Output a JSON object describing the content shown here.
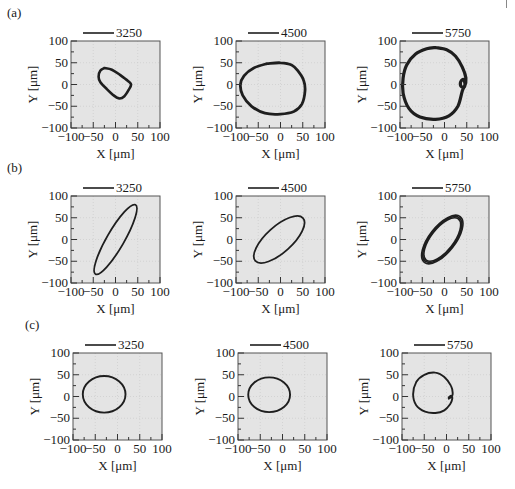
{
  "figure": {
    "rows": [
      {
        "label": "(a)",
        "label_pos": [
          7,
          17
        ]
      },
      {
        "label": "(b)",
        "label_pos": [
          7,
          172
        ]
      },
      {
        "label": "(c)",
        "label_pos": [
          25,
          329
        ]
      }
    ],
    "column_lefts": [
      71,
      236,
      400
    ],
    "row_tops": [
      41,
      196,
      353
    ],
    "row_offsets": [
      0,
      0,
      2
    ],
    "plot_width": 89,
    "plot_height": 87,
    "plot_bg": "#e4e4e4",
    "frame_color": "#555555",
    "trace_color": "#1e1e1e"
  },
  "axes": {
    "xlabel": "X [μm]",
    "ylabel": "Y [μm]",
    "xlim": [
      -100,
      100
    ],
    "ylim": [
      -100,
      100
    ],
    "xticks": [
      "−100",
      "−50",
      "0",
      "50",
      "100"
    ],
    "yticks": [
      "100",
      "50",
      "0",
      "−50",
      "−100"
    ]
  },
  "chart_data": [
    {
      "type": "line",
      "panel": "(a)",
      "legend": "3250",
      "xlabel": "X [μm]",
      "ylabel": "Y [μm]",
      "xlim": [
        -100,
        100
      ],
      "ylim": [
        -100,
        100
      ],
      "shape": "closed orbit",
      "center": [
        0,
        5
      ],
      "x_range": [
        -38,
        35
      ],
      "y_range": [
        -32,
        38
      ],
      "stroke": 2.6,
      "points": [
        [
          -25,
          38
        ],
        [
          -8,
          34
        ],
        [
          10,
          22
        ],
        [
          28,
          8
        ],
        [
          35,
          0
        ],
        [
          30,
          -12
        ],
        [
          20,
          -27
        ],
        [
          8,
          -32
        ],
        [
          -4,
          -25
        ],
        [
          -20,
          -10
        ],
        [
          -34,
          5
        ],
        [
          -38,
          18
        ],
        [
          -34,
          32
        ],
        [
          -25,
          38
        ]
      ]
    },
    {
      "type": "line",
      "panel": "(a)",
      "legend": "4500",
      "xlabel": "X [μm]",
      "ylabel": "Y [μm]",
      "xlim": [
        -100,
        100
      ],
      "ylim": [
        -100,
        100
      ],
      "shape": "closed orbit",
      "x_range": [
        -90,
        55
      ],
      "y_range": [
        -68,
        50
      ],
      "stroke": 2.8,
      "points": [
        [
          -30,
          48
        ],
        [
          0,
          50
        ],
        [
          25,
          45
        ],
        [
          40,
          30
        ],
        [
          52,
          10
        ],
        [
          55,
          -15
        ],
        [
          48,
          -45
        ],
        [
          30,
          -62
        ],
        [
          0,
          -68
        ],
        [
          -35,
          -66
        ],
        [
          -65,
          -50
        ],
        [
          -85,
          -25
        ],
        [
          -90,
          0
        ],
        [
          -82,
          20
        ],
        [
          -60,
          38
        ],
        [
          -30,
          48
        ]
      ]
    },
    {
      "type": "line",
      "panel": "(a)",
      "legend": "5750",
      "xlabel": "X [μm]",
      "ylabel": "Y [μm]",
      "xlim": [
        -100,
        100
      ],
      "ylim": [
        -100,
        100
      ],
      "shape": "closed orbit with inner loop",
      "x_range": [
        -95,
        48
      ],
      "y_range": [
        -80,
        85
      ],
      "stroke": 3.2,
      "points": [
        [
          -20,
          85
        ],
        [
          5,
          80
        ],
        [
          25,
          65
        ],
        [
          40,
          40
        ],
        [
          48,
          15
        ],
        [
          45,
          -5
        ],
        [
          38,
          -5
        ],
        [
          36,
          5
        ],
        [
          42,
          12
        ],
        [
          46,
          0
        ],
        [
          40,
          -15
        ],
        [
          30,
          -50
        ],
        [
          10,
          -72
        ],
        [
          -20,
          -80
        ],
        [
          -55,
          -75
        ],
        [
          -80,
          -55
        ],
        [
          -93,
          -20
        ],
        [
          -93,
          15
        ],
        [
          -85,
          45
        ],
        [
          -65,
          70
        ],
        [
          -40,
          82
        ],
        [
          -20,
          85
        ]
      ]
    },
    {
      "type": "line",
      "panel": "(b)",
      "legend": "3250",
      "xlabel": "X [μm]",
      "ylabel": "Y [μm]",
      "xlim": [
        -100,
        100
      ],
      "ylim": [
        -100,
        100
      ],
      "shape": "tilted ellipse",
      "ellipse": {
        "cx": 0,
        "cy": 0,
        "rx": 90,
        "ry": 20,
        "angle_deg": 60
      },
      "stroke": 1.8
    },
    {
      "type": "line",
      "panel": "(b)",
      "legend": "4500",
      "xlabel": "X [μm]",
      "ylabel": "Y [μm]",
      "xlim": [
        -100,
        100
      ],
      "ylim": [
        -100,
        100
      ],
      "shape": "tilted ellipse",
      "ellipse": {
        "cx": -3,
        "cy": 0,
        "rx": 72,
        "ry": 30,
        "angle_deg": 42
      },
      "stroke": 1.8
    },
    {
      "type": "line",
      "panel": "(b)",
      "legend": "5750",
      "xlabel": "X [μm]",
      "ylabel": "Y [μm]",
      "xlim": [
        -100,
        100
      ],
      "ylim": [
        -100,
        100
      ],
      "shape": "tilted ellipse (multiple loops)",
      "ellipse": {
        "cx": -5,
        "cy": 0,
        "rx": 62,
        "ry": 28,
        "angle_deg": 52
      },
      "stroke": 3.6
    },
    {
      "type": "line",
      "panel": "(c)",
      "legend": "3250",
      "xlabel": "X [μm]",
      "ylabel": "Y [μm]",
      "xlim": [
        -100,
        100
      ],
      "ylim": [
        -100,
        100
      ],
      "shape": "ellipse",
      "ellipse": {
        "cx": -30,
        "cy": 5,
        "rx": 48,
        "ry": 42,
        "angle_deg": 0
      },
      "stroke": 1.9
    },
    {
      "type": "line",
      "panel": "(c)",
      "legend": "4500",
      "xlabel": "X [μm]",
      "ylabel": "Y [μm]",
      "xlim": [
        -100,
        100
      ],
      "ylim": [
        -100,
        100
      ],
      "shape": "ellipse",
      "ellipse": {
        "cx": -30,
        "cy": 4,
        "rx": 47,
        "ry": 40,
        "angle_deg": 0
      },
      "stroke": 1.9
    },
    {
      "type": "line",
      "panel": "(c)",
      "legend": "5750",
      "xlabel": "X [μm]",
      "ylabel": "Y [μm]",
      "xlim": [
        -100,
        100
      ],
      "ylim": [
        -100,
        100
      ],
      "shape": "open spiral orbit",
      "x_range": [
        -75,
        15
      ],
      "y_range": [
        -38,
        55
      ],
      "stroke": 1.9,
      "points": [
        [
          5,
          -5
        ],
        [
          12,
          0
        ],
        [
          14,
          8
        ],
        [
          10,
          25
        ],
        [
          -5,
          45
        ],
        [
          -25,
          55
        ],
        [
          -50,
          50
        ],
        [
          -68,
          33
        ],
        [
          -75,
          5
        ],
        [
          -68,
          -20
        ],
        [
          -48,
          -35
        ],
        [
          -25,
          -38
        ],
        [
          -5,
          -32
        ],
        [
          8,
          -18
        ],
        [
          13,
          -5
        ],
        [
          10,
          2
        ],
        [
          5,
          -2
        ]
      ]
    }
  ]
}
